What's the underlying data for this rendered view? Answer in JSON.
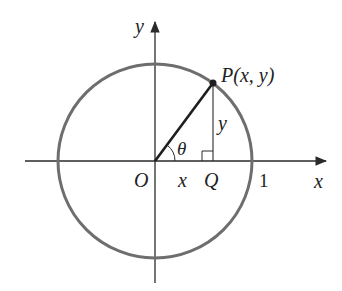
{
  "diagram": {
    "type": "unit-circle",
    "colors": {
      "axis": "#2a2a2a",
      "circle": "#6e6e6e",
      "radius_line": "#1e1e1e",
      "text": "#222222"
    },
    "labels": {
      "y_axis": "y",
      "x_axis": "x",
      "origin": "O",
      "point_p": "P(x, y)",
      "point_q": "Q",
      "angle": "θ",
      "vertical_side": "y",
      "horizontal_side": "x",
      "unit_tick": "1"
    }
  }
}
